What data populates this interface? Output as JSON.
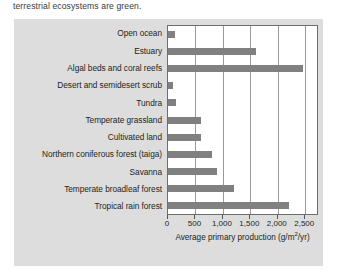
{
  "caption": "terrestrial ecosystems are green.",
  "axis": {
    "title_prefix": "Average primary production (g/m",
    "title_sup": "2",
    "title_suffix": "/yr)",
    "full_title": "Average primary production (g/m2/yr)"
  },
  "colors": {
    "panel_background": "#dddddd",
    "plot_background": "#ffffff",
    "bar_fill": "#808080",
    "gridline": "#9a9a9a",
    "axis_border": "#6d6d6d",
    "text": "#231f20"
  },
  "chart_data": {
    "type": "bar",
    "orientation": "horizontal",
    "title": "",
    "xlabel": "Average primary production (g/m2/yr)",
    "ylabel": "",
    "xlim": [
      0,
      2750
    ],
    "grid": true,
    "legend": "none",
    "xticks": [
      0,
      500,
      1000,
      1500,
      2000,
      2500
    ],
    "xticklabels": [
      "0",
      "500",
      "1,000",
      "1,500",
      "2,000",
      "2,500"
    ],
    "categories": [
      "Open ocean",
      "Estuary",
      "Algal beds and coral reefs",
      "Desert and semidesert scrub",
      "Tundra",
      "Temperate grassland",
      "Cultivated land",
      "Northern coniferous forest (taiga)",
      "Savanna",
      "Temperate broadleaf forest",
      "Tropical rain forest"
    ],
    "values": [
      125,
      1600,
      2450,
      90,
      140,
      600,
      600,
      800,
      900,
      1200,
      2200
    ]
  }
}
